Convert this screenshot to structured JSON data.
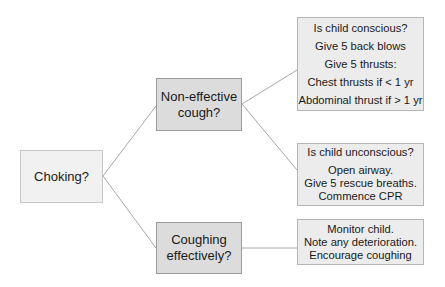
{
  "diagram": {
    "root": {
      "label": "Choking?"
    },
    "branches": [
      {
        "label_lines": [
          "Non-effective",
          "cough?"
        ]
      },
      {
        "label_lines": [
          "Coughing",
          "effectively?"
        ]
      }
    ],
    "outcomes": [
      {
        "lines": [
          "Is child conscious?",
          "Give 5 back blows",
          "Give 5 thrusts:",
          "Chest thrusts if < 1 yr",
          "Abdominal thrust if > 1 yr"
        ]
      },
      {
        "lines": [
          "Is child unconscious?",
          "Open airway.",
          "Give 5 rescue breaths.",
          "Commence CPR"
        ]
      },
      {
        "lines": [
          "Monitor child.",
          "Note any deterioration.",
          "Encourage coughing"
        ]
      }
    ],
    "colors": {
      "line": "#a8a8a8",
      "root_fill": "#f1f1f1",
      "branch_fill": "#dcdcdc",
      "outcome_fill": "#ececec"
    }
  }
}
